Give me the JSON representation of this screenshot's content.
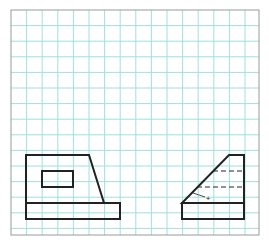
{
  "diagram": {
    "type": "orthographic-projection-sketch",
    "background": "#ffffff",
    "grid": {
      "color": "#9fe0df",
      "border_color": "#9a9a9a",
      "origin_x": 11,
      "origin_y": 10,
      "width": 248,
      "height": 225,
      "spacing": 15.6
    },
    "line_color": "#222222",
    "views": [
      {
        "name": "front-view",
        "outline": [
          [
            26,
            155
          ],
          [
            89,
            155
          ],
          [
            104,
            203
          ],
          [
            26,
            203
          ]
        ],
        "base": {
          "x": 26,
          "y": 203,
          "w": 94,
          "h": 16
        },
        "inner_rect": {
          "x": 42,
          "y": 171,
          "w": 31,
          "h": 16
        }
      },
      {
        "name": "side-view",
        "outline": [
          [
            229,
            155
          ],
          [
            244,
            155
          ],
          [
            244,
            203
          ],
          [
            182,
            203
          ]
        ],
        "base": {
          "x": 182,
          "y": 203,
          "w": 62,
          "h": 16
        },
        "hidden_lines": [
          {
            "x1": 213,
            "y1": 171,
            "x2": 244,
            "y2": 171
          },
          {
            "x1": 197,
            "y1": 187,
            "x2": 244,
            "y2": 187
          }
        ],
        "leader": {
          "x1": 193,
          "y1": 193,
          "x2": 205,
          "y2": 197
        },
        "marker": {
          "x": 208,
          "y": 198,
          "symbol": "+"
        }
      }
    ]
  }
}
